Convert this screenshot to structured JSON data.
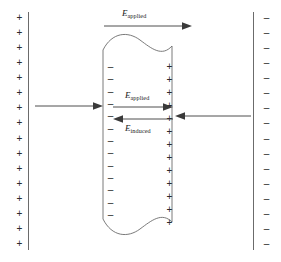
{
  "figure": {
    "name": "dielectric-slab-in-capacitor-field-diagram",
    "background_color": "#ffffff",
    "line_color": "#6b6b6b",
    "charge_color": "#2b2b2b",
    "arrow_color": "#3a3a3a",
    "width": 281,
    "height": 262
  },
  "labels": {
    "e_applied_top": {
      "symbol": "E",
      "subscript": "applied"
    },
    "e_applied_inner": {
      "symbol": "E",
      "subscript": "applied"
    },
    "e_induced_inner": {
      "symbol": "E",
      "subscript": "induced"
    }
  },
  "left_plate": {
    "polarity": "positive",
    "charge_symbol": "+",
    "charge_count": 16
  },
  "right_plate": {
    "polarity": "negative",
    "charge_symbol": "–",
    "charge_count": 16
  },
  "slab": {
    "left_face": {
      "polarity": "negative",
      "charge_symbol": "–",
      "charge_count": 13
    },
    "right_face": {
      "polarity": "positive",
      "charge_symbol": "+",
      "charge_count": 13
    }
  },
  "arrows": {
    "top_applied": {
      "direction": "right"
    },
    "inner_applied": {
      "direction": "right"
    },
    "inner_induced": {
      "direction": "left"
    },
    "right_external": {
      "direction": "left"
    }
  }
}
